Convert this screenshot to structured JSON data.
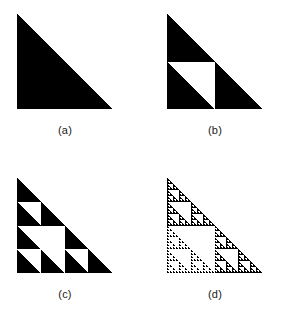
{
  "figure": {
    "kind": "sierpinski-triangle-construction",
    "background_color": "#ffffff",
    "ink_color": "#000000",
    "shape": "right-triangle",
    "right_angle_corner": "bottom-left",
    "vertices_normalized": [
      [
        0,
        0
      ],
      [
        0,
        1
      ],
      [
        1,
        1
      ]
    ],
    "panel_size_px": 95,
    "panels": [
      {
        "id": "a",
        "label": "(a)",
        "iteration": 0,
        "holes": 0,
        "filled_subtriangles": 1,
        "description": "solid right triangle"
      },
      {
        "id": "b",
        "label": "(b)",
        "iteration": 1,
        "holes": 1,
        "filled_subtriangles": 3,
        "description": "middle sub-triangle removed"
      },
      {
        "id": "c",
        "label": "(c)",
        "iteration": 2,
        "holes": 4,
        "filled_subtriangles": 9,
        "description": "second iteration, four white holes"
      },
      {
        "id": "d",
        "label": "(d)",
        "iteration": 5,
        "holes": 364,
        "filled_subtriangles": 243,
        "description": "fifth iteration, fine fractal detail"
      }
    ]
  }
}
